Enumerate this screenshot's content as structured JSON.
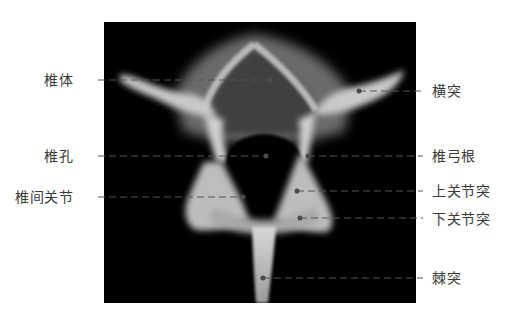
{
  "figure": {
    "image_description": "vertebra-xray-axial",
    "colors": {
      "background": "#ffffff",
      "xray_background": "#000000",
      "label_text": "#3a3a3a",
      "leader_line": "#555555",
      "leader_dot": "#444444"
    }
  },
  "labels": {
    "left": [
      {
        "id": "vertebral-body",
        "text": "椎体",
        "x": 73,
        "y": 80,
        "target": [
          270,
          80
        ]
      },
      {
        "id": "vertebral-foramen",
        "text": "椎孔",
        "x": 73,
        "y": 156,
        "target": [
          266,
          156
        ]
      },
      {
        "id": "facet-joint",
        "text": "椎间关节",
        "x": 73,
        "y": 197,
        "target": [
          243,
          197
        ]
      }
    ],
    "right": [
      {
        "id": "transverse-process",
        "text": "横突",
        "x": 447,
        "y": 91,
        "target": [
          359,
          91
        ]
      },
      {
        "id": "pedicle",
        "text": "椎弓根",
        "x": 447,
        "y": 156,
        "target": [
          308,
          156
        ]
      },
      {
        "id": "superior-articular-process",
        "text": "上关节突",
        "x": 447,
        "y": 191,
        "target": [
          297,
          191
        ]
      },
      {
        "id": "inferior-articular-process",
        "text": "下关节突",
        "x": 447,
        "y": 220,
        "target": [
          300,
          218
        ]
      },
      {
        "id": "spinous-process",
        "text": "棘突",
        "x": 447,
        "y": 278,
        "target": [
          263,
          278
        ]
      }
    ]
  }
}
